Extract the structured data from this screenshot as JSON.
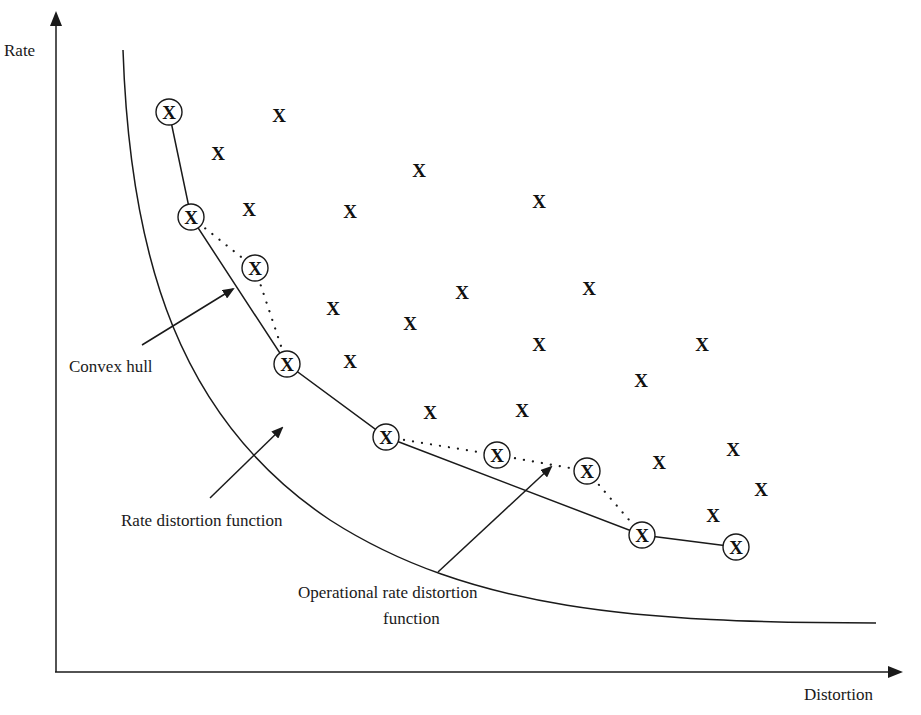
{
  "axes": {
    "y_label": "Rate",
    "x_label": "Distortion"
  },
  "labels": {
    "convex_hull": "Convex hull",
    "rate_distortion": "Rate distortion function",
    "operational_line1": "Operational rate distortion",
    "operational_line2": "function"
  },
  "marker_glyph": "X",
  "operational_points": [
    {
      "x": 169,
      "y": 112
    },
    {
      "x": 191,
      "y": 217
    },
    {
      "x": 255,
      "y": 268
    },
    {
      "x": 287,
      "y": 364
    },
    {
      "x": 386,
      "y": 437
    },
    {
      "x": 497,
      "y": 455
    },
    {
      "x": 587,
      "y": 471
    },
    {
      "x": 642,
      "y": 535
    },
    {
      "x": 736,
      "y": 547
    }
  ],
  "convex_hull_indices": [
    0,
    1,
    3,
    4,
    7,
    8
  ],
  "dotted_segments": [
    [
      1,
      2
    ],
    [
      2,
      3
    ],
    [
      4,
      5
    ],
    [
      5,
      6
    ],
    [
      6,
      7
    ]
  ],
  "other_points": [
    {
      "x": 279,
      "y": 115
    },
    {
      "x": 218,
      "y": 153
    },
    {
      "x": 419,
      "y": 170
    },
    {
      "x": 249,
      "y": 209
    },
    {
      "x": 350,
      "y": 211
    },
    {
      "x": 539,
      "y": 201
    },
    {
      "x": 462,
      "y": 292
    },
    {
      "x": 589,
      "y": 288
    },
    {
      "x": 333,
      "y": 308
    },
    {
      "x": 410,
      "y": 323
    },
    {
      "x": 539,
      "y": 344
    },
    {
      "x": 702,
      "y": 344
    },
    {
      "x": 350,
      "y": 361
    },
    {
      "x": 641,
      "y": 380
    },
    {
      "x": 430,
      "y": 412
    },
    {
      "x": 522,
      "y": 410
    },
    {
      "x": 733,
      "y": 449
    },
    {
      "x": 659,
      "y": 462
    },
    {
      "x": 761,
      "y": 489
    },
    {
      "x": 713,
      "y": 515
    }
  ]
}
